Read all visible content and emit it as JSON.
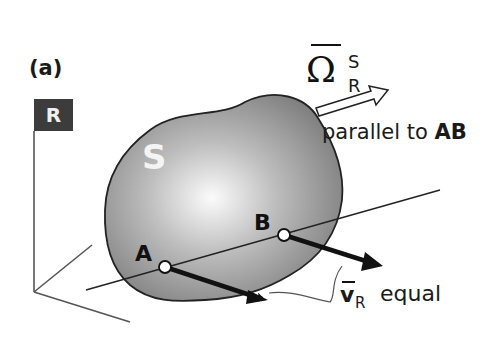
{
  "figure": {
    "panel_label": "(a)",
    "reference_frame": {
      "label": "R",
      "box_color": "#3c3c3c"
    },
    "rigid_body": {
      "label": "S",
      "fill_gradient": [
        "#f8f8f8",
        "#8a8a8a"
      ]
    },
    "points": [
      {
        "label": "A",
        "x": 165,
        "y": 267
      },
      {
        "label": "B",
        "x": 284,
        "y": 235
      }
    ],
    "angular_velocity": {
      "symbol": "Ω",
      "superscript": "S",
      "subscript": "R",
      "annotation_text": "parallel to ",
      "annotation_bold": "AB"
    },
    "velocity": {
      "symbol": "v",
      "subscript": "R",
      "annotation": "equal"
    }
  }
}
